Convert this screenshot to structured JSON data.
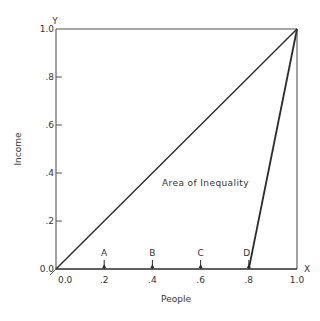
{
  "chart_data": {
    "type": "line",
    "title": "",
    "xlabel": "People",
    "ylabel": "Income",
    "x_axis_letter": "X",
    "y_axis_letter": "Y",
    "xlim": [
      0.0,
      1.0
    ],
    "ylim": [
      0.0,
      1.0
    ],
    "x_ticks": [
      {
        "value": 0.0,
        "label": "0.0"
      },
      {
        "value": 0.2,
        "label": ".2"
      },
      {
        "value": 0.4,
        "label": ".4"
      },
      {
        "value": 0.6,
        "label": ".6"
      },
      {
        "value": 0.8,
        "label": ".8"
      },
      {
        "value": 1.0,
        "label": "1.0"
      }
    ],
    "y_ticks": [
      {
        "value": 0.0,
        "label": "0.0"
      },
      {
        "value": 0.2,
        "label": ".2"
      },
      {
        "value": 0.4,
        "label": ".4"
      },
      {
        "value": 0.6,
        "label": ".6"
      },
      {
        "value": 0.8,
        "label": ".8"
      },
      {
        "value": 1.0,
        "label": "1.0"
      }
    ],
    "grid": false,
    "series": [
      {
        "name": "Line of equality",
        "points": [
          [
            0.0,
            0.0
          ],
          [
            1.0,
            1.0
          ]
        ]
      },
      {
        "name": "Unequal distribution",
        "points": [
          [
            0.8,
            0.0
          ],
          [
            1.0,
            1.0
          ]
        ]
      }
    ],
    "markers": [
      {
        "label": "A",
        "x": 0.2
      },
      {
        "label": "B",
        "x": 0.4
      },
      {
        "label": "C",
        "x": 0.6
      },
      {
        "label": "D",
        "x": 0.8
      }
    ],
    "annotations": [
      {
        "text": "Area of Inequality",
        "x": 0.44,
        "y": 0.36
      }
    ]
  },
  "colors": {
    "line": "#2b2b2b",
    "frame": "#555555",
    "text": "#333333"
  }
}
